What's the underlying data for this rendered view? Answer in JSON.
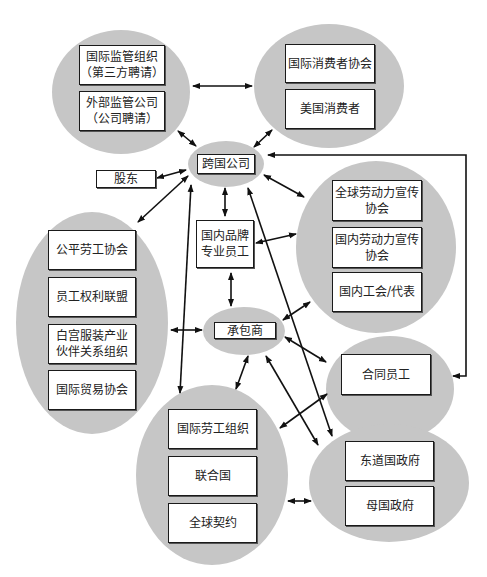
{
  "diagram": {
    "title": "",
    "groups": {
      "oversight": {
        "items": [
          "国际监管组织\n（第三方聘请）",
          "外部监管公司\n（公司聘请）"
        ]
      },
      "consumers": {
        "items": [
          "国际消费者协会",
          "美国消费者"
        ]
      },
      "mnc": {
        "label": "跨国公司"
      },
      "shareholders": {
        "label": "股东"
      },
      "brand_staff": {
        "label": "国内品牌\n专业员工"
      },
      "advocacy": {
        "items": [
          "全球劳动力宣传\n协会",
          "国内劳动力宣传\n协会",
          "国内工会/代表"
        ]
      },
      "ngos": {
        "items": [
          "公平劳工协会",
          "员工权利联盟",
          "白宫服装产业\n伙伴关系组织",
          "国际贸易协会"
        ]
      },
      "contractor": {
        "label": "承包商"
      },
      "contract_workers": {
        "label": "合同员工"
      },
      "intl_orgs": {
        "items": [
          "国际劳工组织",
          "联合国",
          "全球契约"
        ]
      },
      "governments": {
        "items": [
          "东道国政府",
          "母国政府"
        ]
      }
    },
    "colors": {
      "blob_fill": "#c6c6c6",
      "box_fill": "#ffffff",
      "stroke": "#111111"
    },
    "edges": [
      {
        "from": "oversight",
        "to": "consumers",
        "type": "bidirectional"
      },
      {
        "from": "oversight",
        "to": "mnc",
        "type": "bidirectional"
      },
      {
        "from": "consumers",
        "to": "mnc",
        "type": "bidirectional"
      },
      {
        "from": "mnc",
        "to": "shareholders",
        "type": "bidirectional"
      },
      {
        "from": "mnc",
        "to": "ngos",
        "type": "bidirectional"
      },
      {
        "from": "mnc",
        "to": "brand_staff",
        "type": "bidirectional"
      },
      {
        "from": "mnc",
        "to": "advocacy",
        "type": "bidirectional"
      },
      {
        "from": "mnc",
        "to": "contract_workers",
        "type": "bidirectional"
      },
      {
        "from": "mnc",
        "to": "intl_orgs",
        "type": "bidirectional"
      },
      {
        "from": "mnc",
        "to": "governments",
        "type": "bidirectional"
      },
      {
        "from": "brand_staff",
        "to": "advocacy",
        "type": "bidirectional"
      },
      {
        "from": "brand_staff",
        "to": "contractor",
        "type": "bidirectional"
      },
      {
        "from": "ngos",
        "to": "contractor",
        "type": "bidirectional"
      },
      {
        "from": "contractor",
        "to": "advocacy",
        "type": "bidirectional"
      },
      {
        "from": "contractor",
        "to": "contract_workers",
        "type": "bidirectional"
      },
      {
        "from": "contractor",
        "to": "intl_orgs",
        "type": "bidirectional"
      },
      {
        "from": "contractor",
        "to": "governments",
        "type": "bidirectional"
      },
      {
        "from": "intl_orgs",
        "to": "contract_workers",
        "type": "bidirectional"
      },
      {
        "from": "intl_orgs",
        "to": "governments",
        "type": "bidirectional"
      }
    ]
  }
}
